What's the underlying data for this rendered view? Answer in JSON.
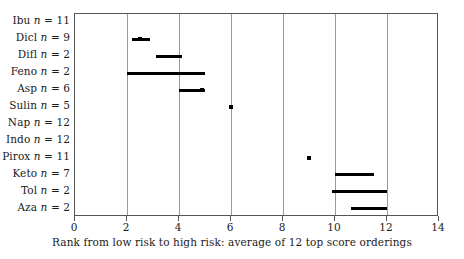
{
  "chart_data": {
    "type": "bar",
    "title": "",
    "subtitle": "",
    "xlabel": "Rank from low risk to high risk: average of 12 top score orderings",
    "ylabel": "",
    "xlim": [
      0,
      14
    ],
    "xticks": [
      0,
      2,
      4,
      6,
      8,
      10,
      12,
      14
    ],
    "xtick_labels": [
      "0",
      "2",
      "4",
      "6",
      "8",
      "10",
      "12",
      "14"
    ],
    "grid": "vertical",
    "legend": "none",
    "categories": [
      "Ibu n = 11",
      "Dicl n = 9",
      "Difl n = 2",
      "Feno n = 2",
      "Asp n = 6",
      "Sulin n = 5",
      "Nap n = 12",
      "Indo n = 12",
      "Pirox n = 11",
      "Keto n = 7",
      "Tol n = 2",
      "Aza n = 2"
    ],
    "rows": [
      {
        "drug": "Ibu",
        "n": 11,
        "label_name": "Ibu",
        "label_n": "11",
        "interval": null,
        "point": null
      },
      {
        "drug": "Dicl",
        "n": 9,
        "label_name": "Dicl",
        "label_n": "9",
        "interval": [
          2.2,
          2.9
        ],
        "point": 2.5
      },
      {
        "drug": "Difl",
        "n": 2,
        "label_name": "Difl",
        "label_n": "2",
        "interval": [
          3.1,
          4.1
        ],
        "point": null
      },
      {
        "drug": "Feno",
        "n": 2,
        "label_name": "Feno",
        "label_n": "2",
        "interval": [
          2.0,
          5.0
        ],
        "point": null
      },
      {
        "drug": "Asp",
        "n": 6,
        "label_name": "Asp",
        "label_n": "6",
        "interval": [
          4.0,
          5.0
        ],
        "point": 4.9
      },
      {
        "drug": "Sulin",
        "n": 5,
        "label_name": "Sulin",
        "label_n": "5",
        "interval": null,
        "point": 6.0
      },
      {
        "drug": "Nap",
        "n": 12,
        "label_name": "Nap",
        "label_n": "12",
        "interval": null,
        "point": null
      },
      {
        "drug": "Indo",
        "n": 12,
        "label_name": "Indo",
        "label_n": "12",
        "interval": null,
        "point": null
      },
      {
        "drug": "Pirox",
        "n": 11,
        "label_name": "Pirox",
        "label_n": "11",
        "interval": null,
        "point": 9.0
      },
      {
        "drug": "Keto",
        "n": 7,
        "label_name": "Keto",
        "label_n": "7",
        "interval": [
          10.0,
          11.5
        ],
        "point": null
      },
      {
        "drug": "Tol",
        "n": 2,
        "label_name": "Tol",
        "label_n": "2",
        "interval": [
          9.9,
          12.0
        ],
        "point": null
      },
      {
        "drug": "Aza",
        "n": 2,
        "label_name": "Aza",
        "label_n": "2",
        "interval": [
          10.6,
          12.0
        ],
        "point": null
      }
    ],
    "colors": {
      "mark": "#000000",
      "gridline": "#9a9a9a",
      "axis": "#555555",
      "background": "#ffffff"
    }
  }
}
